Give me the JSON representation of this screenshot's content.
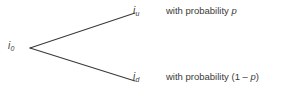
{
  "diagram": {
    "type": "binomial-tree-one-step",
    "background_color": "#ffffff",
    "stroke_color": "#3a3a3a",
    "text_color": "#3a3a3a",
    "nodes": {
      "root": {
        "symbol": "i",
        "subscript": "0"
      },
      "up": {
        "symbol": "i",
        "subscript": "u"
      },
      "down": {
        "symbol": "i",
        "subscript": "d"
      }
    },
    "branches": {
      "up": {
        "prefix": "with probability ",
        "variable": "p",
        "suffix": ""
      },
      "down": {
        "prefix": "with probability (1 – ",
        "variable": "p",
        "suffix": ")"
      }
    },
    "geometry": {
      "vertex_x": 30,
      "vertex_y": 48,
      "up_end_x": 135,
      "up_end_y": 13,
      "down_end_x": 135,
      "down_end_y": 81
    }
  }
}
